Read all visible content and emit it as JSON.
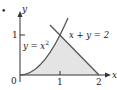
{
  "figure": {
    "bullet": "•",
    "axes": {
      "x_label": "x",
      "y_label": "y",
      "origin_label": "0",
      "x_ticks": [
        "1",
        "2"
      ],
      "y_ticks": [
        "1"
      ]
    },
    "curves": [
      {
        "name": "parabola",
        "equation": "y = x²",
        "eq_lhs": "y = x",
        "eq_sup": "2"
      },
      {
        "name": "line",
        "equation": "x + y = 2"
      }
    ],
    "shaded_region": "region bounded by y = x², x + y = 2, and y = 0",
    "colors": {
      "axis": "#333333",
      "curve": "#555555",
      "fill": "#e4e4e4"
    }
  }
}
